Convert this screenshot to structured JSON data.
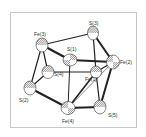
{
  "diagram": {
    "type": "ORTEP crystal structure",
    "atoms": [
      {
        "id": "Fe3",
        "label": "Fe(3)",
        "element": "Fe",
        "x": 42,
        "y": 45
      },
      {
        "id": "S3",
        "label": "S(3)",
        "element": "S",
        "x": 93,
        "y": 33
      },
      {
        "id": "S1",
        "label": "S(1)",
        "element": "S",
        "x": 70,
        "y": 60
      },
      {
        "id": "Fe2",
        "label": "Fe(2)",
        "element": "Fe",
        "x": 113,
        "y": 62
      },
      {
        "id": "S4",
        "label": "S(4)",
        "element": "S",
        "x": 48,
        "y": 72
      },
      {
        "id": "Fe1",
        "label": "Fe(1)",
        "element": "Fe",
        "x": 96,
        "y": 72
      },
      {
        "id": "S2",
        "label": "S(2)",
        "element": "S",
        "x": 30,
        "y": 88
      },
      {
        "id": "Fe4",
        "label": "Fe(4)",
        "element": "Fe",
        "x": 68,
        "y": 108
      },
      {
        "id": "S5",
        "label": "S(5)",
        "element": "S",
        "x": 100,
        "y": 107
      }
    ],
    "labels": {
      "Fe3": "Fe(3)",
      "S3": "S(3)",
      "S1": "S(1)",
      "Fe2": "Fe(2)",
      "S4": "S(4)",
      "Fe1": "Fe(1)",
      "S2": "S(2)",
      "Fe4": "Fe(4)",
      "S5": "S(5)"
    }
  }
}
